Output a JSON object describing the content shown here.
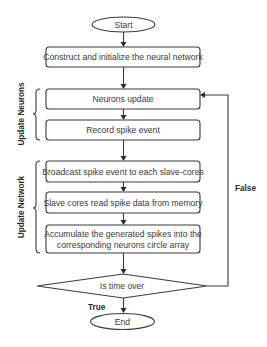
{
  "diagram": {
    "type": "flowchart",
    "nodes": {
      "start": {
        "label": "Start",
        "shape": "terminal"
      },
      "construct": {
        "label": "Construct and initialize the neural network",
        "shape": "process"
      },
      "neurons_update": {
        "label": "Neurons update",
        "shape": "process"
      },
      "record_spike": {
        "label": "Record spike event",
        "shape": "process"
      },
      "broadcast": {
        "label": "Broadcast spike event to each slave-cores",
        "shape": "process"
      },
      "slave_read": {
        "label": "Slave cores read spike data from memory",
        "shape": "process"
      },
      "accumulate": {
        "label_line1": "Accumulate the generated spikes into the",
        "label_line2": "corresponding neurons circle array",
        "shape": "process"
      },
      "decision": {
        "label": "Is time over",
        "shape": "decision"
      },
      "end": {
        "label": "End",
        "shape": "terminal"
      }
    },
    "groups": {
      "update_neurons": {
        "label": "Update Neurons"
      },
      "update_network": {
        "label": "Update Network"
      }
    },
    "edge_labels": {
      "true": "True",
      "false": "False"
    },
    "edges": [
      [
        "start",
        "construct"
      ],
      [
        "construct",
        "neurons_update"
      ],
      [
        "neurons_update",
        "record_spike"
      ],
      [
        "record_spike",
        "broadcast"
      ],
      [
        "broadcast",
        "slave_read"
      ],
      [
        "slave_read",
        "accumulate"
      ],
      [
        "accumulate",
        "decision"
      ],
      [
        "decision",
        "end",
        "True"
      ],
      [
        "decision",
        "neurons_update",
        "False"
      ]
    ],
    "colors": {
      "stroke": "#3a3a3a",
      "fill": "#ffffff",
      "text": "#3a3a3a"
    }
  }
}
